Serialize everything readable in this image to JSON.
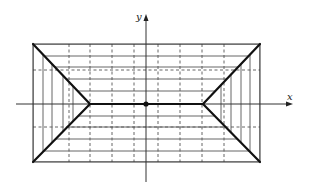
{
  "diagram": {
    "type": "geometric-construction",
    "axes": {
      "x_label": "x",
      "y_label": "y",
      "origin_marker": "dot"
    },
    "colors": {
      "line": "#222222",
      "thin_line": "#555555",
      "background": "#ffffff"
    },
    "geometry": {
      "rect": {
        "left": 33,
        "top": 44,
        "right": 260,
        "bottom": 162
      },
      "ridge": {
        "x1": 90,
        "x2": 203,
        "y": 104
      },
      "origin": {
        "x": 146,
        "y": 104
      },
      "x_axis": {
        "x1": 16,
        "x2": 293,
        "y": 104
      },
      "y_axis": {
        "x": 146,
        "y1": 14,
        "y2": 182
      },
      "dashed_verticals": [
        69,
        90,
        112,
        134,
        158,
        180,
        202,
        224
      ],
      "dashed_horizontals": [
        70,
        127
      ],
      "solid_horizontals": [
        44,
        56,
        67,
        79,
        91,
        116,
        127,
        139,
        151,
        162
      ],
      "left_solid_verticals": [
        33,
        43,
        52,
        63,
        73
      ],
      "right_solid_verticals": [
        221,
        231,
        241,
        250,
        260
      ]
    }
  }
}
